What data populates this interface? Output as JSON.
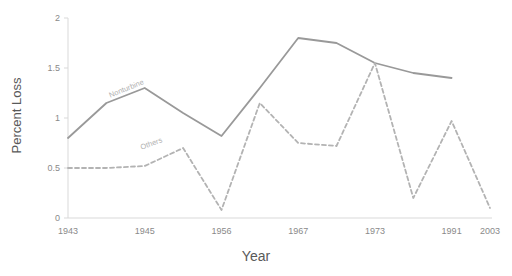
{
  "chart_data": {
    "type": "line",
    "title": "",
    "xlabel": "Year",
    "ylabel": "Percent Loss",
    "ylim": [
      0,
      2
    ],
    "yticks": [
      "0",
      "0.5",
      "1",
      "1.5",
      "2"
    ],
    "ytick_values": [
      0,
      0.5,
      1,
      1.5,
      2
    ],
    "grid": false,
    "legend_position": "inline-labels",
    "x": [
      1943,
      1944,
      1945,
      1950,
      1956,
      1961,
      1967,
      1970,
      1973,
      1980,
      1991,
      2003
    ],
    "xtick_labels": [
      "1943",
      "1945",
      "1956",
      "1967",
      "1973",
      "1991",
      "2003"
    ],
    "xtick_values": [
      1943,
      1945,
      1956,
      1967,
      1973,
      1991,
      2003
    ],
    "series": [
      {
        "name": "Nonturbine",
        "style": "solid",
        "color": "#999999",
        "x": [
          1943,
          1944,
          1945,
          1950,
          1956,
          1961,
          1967,
          1970,
          1973,
          1980,
          1991
        ],
        "values": [
          0.8,
          1.15,
          1.3,
          1.05,
          0.82,
          1.3,
          1.8,
          1.75,
          1.55,
          1.45,
          1.4
        ]
      },
      {
        "name": "Others",
        "style": "dashed",
        "color": "#b3b3b3",
        "x": [
          1943,
          1944,
          1945,
          1950,
          1956,
          1961,
          1967,
          1970,
          1973,
          1980,
          1991,
          2003
        ],
        "values": [
          0.5,
          0.5,
          0.52,
          0.7,
          0.08,
          1.15,
          0.75,
          0.72,
          1.55,
          0.2,
          0.97,
          0.1
        ]
      }
    ],
    "annotations": [
      {
        "text": "Nonturbine",
        "series": "Nonturbine",
        "rotation": -22
      },
      {
        "text": "Others",
        "series": "Others",
        "rotation": -20
      }
    ]
  }
}
